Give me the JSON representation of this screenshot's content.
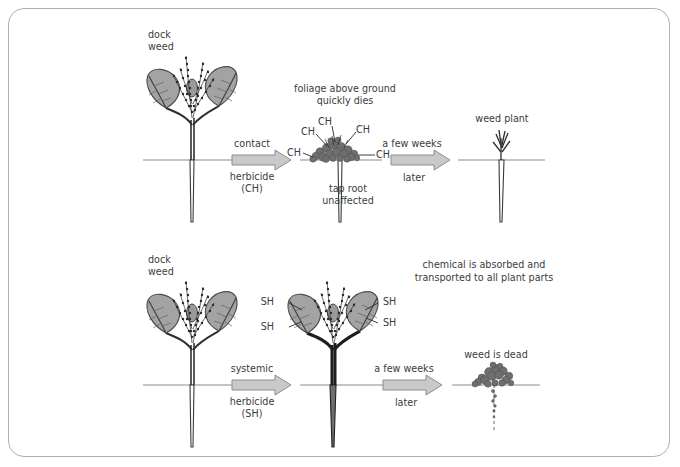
{
  "figure": {
    "frame_color": "#b0b0b0",
    "background": "#ffffff"
  },
  "palette": {
    "leaf_fill": "#a3a3a3",
    "ink": "#3c3c3c",
    "ground_line": "#8c8c8c",
    "arrow_fill": "#c9c9c9",
    "arrow_stroke": "#8d8d8d"
  },
  "rows": [
    {
      "id": "contact-row",
      "stages": [
        {
          "id": "contact-stage-1",
          "caption": "dock\nweed",
          "caption_line1": "dock",
          "caption_line2": "weed"
        },
        {
          "id": "contact-arrow-1",
          "above": "contact",
          "below_line1": "herbicide",
          "below_line2": "(CH)"
        },
        {
          "id": "contact-stage-2",
          "caption_line1": "foliage above ground",
          "caption_line2": "quickly dies",
          "note_line1": "tap root",
          "note_line2": "unaffected",
          "chem_labels": [
            "CH",
            "CH",
            "CH",
            "CH"
          ]
        },
        {
          "id": "contact-arrow-2",
          "above": "a few weeks",
          "below": "later"
        },
        {
          "id": "contact-stage-3",
          "caption_line1": "weed plant",
          "caption_line2": "re-emerges"
        }
      ]
    },
    {
      "id": "systemic-row",
      "stages": [
        {
          "id": "systemic-stage-1",
          "caption_line1": "dock",
          "caption_line2": "weed"
        },
        {
          "id": "systemic-arrow-1",
          "above": "systemic",
          "below_line1": "herbicide",
          "below_line2": "(SH)"
        },
        {
          "id": "systemic-stage-2",
          "caption_line1": "chemical is absorbed and",
          "caption_line2": "transported to all plant parts",
          "chem_labels": [
            "SH",
            "SH",
            "SH",
            "SH"
          ]
        },
        {
          "id": "systemic-arrow-2",
          "above": "a few weeks",
          "below": "later"
        },
        {
          "id": "systemic-stage-3",
          "caption": "weed is dead"
        }
      ]
    }
  ]
}
